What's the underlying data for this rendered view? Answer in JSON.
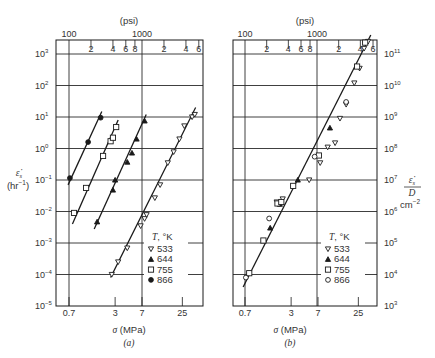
{
  "chart_data": [
    {
      "panel": "a",
      "type": "scatter",
      "caption": "(a)",
      "title": "",
      "xlabel": "σ (MPa)",
      "x_top_label": "(psi)",
      "x_scale": "log",
      "x_ticks_bottom": [
        "0.7",
        "3",
        "7",
        "25"
      ],
      "x_ticks_top_major": [
        "100",
        "1000"
      ],
      "x_ticks_top_minor": [
        "2",
        "4",
        "6",
        "8",
        "2",
        "4",
        "6"
      ],
      "ylabel": "ε̇s (hr⁻¹)",
      "y_scale": "log",
      "ylim": [
        1e-05,
        5000.0
      ],
      "y_ticks": [
        "10^3",
        "10^2",
        "10^1",
        "10^0",
        "10^-1",
        "10^-2",
        "10^-3",
        "10^-4",
        "10^-5"
      ],
      "grid": true,
      "legend": {
        "title": "T, °K",
        "position": "lower right",
        "entries": [
          {
            "marker": "∇",
            "label": "533"
          },
          {
            "marker": "▲",
            "label": "644"
          },
          {
            "marker": "□",
            "label": "755"
          },
          {
            "marker": "●",
            "label": "866"
          }
        ]
      },
      "series": [
        {
          "name": "866",
          "marker": "filled-circle",
          "x": [
            0.72,
            1.28,
            1.9
          ],
          "y": [
            0.115,
            1.6,
            9.5
          ],
          "fit_line": [
            [
              0.68,
              0.07
            ],
            [
              1.97,
              15
            ]
          ]
        },
        {
          "name": "755",
          "marker": "open-square",
          "x": [
            0.82,
            1.2,
            2.05,
            2.6,
            2.8,
            3.1
          ],
          "y": [
            0.009,
            0.056,
            0.58,
            1.7,
            2.2,
            4.8
          ],
          "fit_line": [
            [
              0.78,
              0.004
            ],
            [
              3.3,
              8
            ]
          ]
        },
        {
          "name": "644",
          "marker": "filled-triangle",
          "x": [
            1.7,
            2.8,
            3.0,
            4.4,
            5.1,
            5.9,
            7.6
          ],
          "y": [
            0.0047,
            0.048,
            0.1,
            0.37,
            0.72,
            2.0,
            7.5
          ],
          "fit_line": [
            [
              1.55,
              0.0028
            ],
            [
              8.0,
              12
            ]
          ]
        },
        {
          "name": "533",
          "marker": "open-inverted-triangle",
          "x": [
            2.7,
            3.3,
            4.4,
            6.7,
            7.6,
            8.1,
            10.5,
            12.4,
            15.8,
            19,
            22.8,
            26.6,
            34,
            37
          ],
          "y": [
            0.0001,
            0.00025,
            0.00069,
            0.0035,
            0.0059,
            0.0079,
            0.027,
            0.07,
            0.35,
            0.78,
            2.0,
            5.2,
            10,
            12
          ],
          "fit_line": [
            [
              2.6,
              8e-05
            ],
            [
              38,
              20
            ]
          ]
        }
      ]
    },
    {
      "panel": "b",
      "type": "scatter",
      "caption": "(b)",
      "title": "",
      "xlabel": "σ (MPa)",
      "x_top_label": "(psi)",
      "x_scale": "log",
      "x_ticks_bottom": [
        "0.7",
        "3",
        "7",
        "25"
      ],
      "x_ticks_top_major": [
        "100",
        "1000"
      ],
      "x_ticks_top_minor": [
        "2",
        "4",
        "6",
        "8",
        "2",
        "4",
        "6"
      ],
      "ylabel": "ε̇s / D (cm⁻²)",
      "y_scale": "log",
      "ylim": [
        1000.0,
        500000000000.0
      ],
      "y_ticks": [
        "10^11",
        "10^10",
        "10^9",
        "10^8",
        "10^7",
        "10^6",
        "10^5",
        "10^4",
        "10^3"
      ],
      "grid": true,
      "legend": {
        "title": "T, °K",
        "position": "lower right",
        "entries": [
          {
            "marker": "∇",
            "label": "533"
          },
          {
            "marker": "▲",
            "label": "644"
          },
          {
            "marker": "□",
            "label": "755"
          },
          {
            "marker": "○",
            "label": "866"
          }
        ]
      },
      "series": [
        {
          "name": "533",
          "marker": "open-inverted-triangle",
          "x": [
            1.9,
            2.3,
            5.3,
            7.5,
            9.5,
            12,
            14,
            17,
            22,
            26,
            30,
            34
          ],
          "y": [
            2000000.0,
            2500000.0,
            10000000.0,
            35000000.0,
            110000000.0,
            150000000.0,
            900000000.0,
            2500000000.0,
            12000000000.0,
            35000000000.0,
            150000000000.0,
            250000000000.0
          ],
          "fit_line": [
            [
              0.66,
              4000.0
            ],
            [
              37,
              400000000000.0
            ]
          ]
        },
        {
          "name": "644",
          "marker": "filled-triangle",
          "x": [
            1.55,
            2.1,
            3.7,
            10.2
          ],
          "y": [
            300000.0,
            1700000.0,
            10000000.0,
            450000000.0
          ],
          "fit_line": null
        },
        {
          "name": "755",
          "marker": "open-square",
          "x": [
            0.8,
            1.25,
            1.95,
            2.2,
            3.2,
            7.2,
            24,
            31
          ],
          "y": [
            11000.0,
            120000.0,
            1800000.0,
            2000000.0,
            6500000.0,
            60000000.0,
            40000000000.0,
            230000000000.0
          ],
          "fit_line": null
        },
        {
          "name": "866",
          "marker": "open-circle",
          "x": [
            0.72,
            1.5,
            6.3,
            17
          ],
          "y": [
            8000.0,
            600000.0,
            55000000.0,
            3000000000.0
          ],
          "fit_line": null
        }
      ]
    }
  ],
  "panels": {
    "a": {
      "psi_label": "(psi)",
      "psi_major": [
        "100",
        "1000"
      ],
      "psi_minor": [
        "2",
        "4",
        "6",
        "8",
        "2",
        "4",
        "6"
      ],
      "y_tick_labels": [
        "10",
        "10",
        "10",
        "10",
        "10",
        "10",
        "10",
        "10",
        "10"
      ],
      "y_tick_exps": [
        "3",
        "2",
        "1",
        "0",
        "−1",
        "−2",
        "−3",
        "−4",
        "−5"
      ],
      "x_labels": [
        "0.7",
        "3",
        "7",
        "25"
      ],
      "ylabel_line1": "ε̇",
      "ylabel_sub": "s",
      "ylabel_line2": "(hr",
      "ylabel_exp": "−1",
      "ylabel_close": ")",
      "xlabel_sigma": "σ",
      "xlabel_unit": " (MPa)",
      "caption": "(a)",
      "legend_title": "T, °K",
      "legend": [
        "533",
        "644",
        "755",
        "866"
      ]
    },
    "b": {
      "psi_label": "(psi)",
      "psi_major": [
        "100",
        "1000"
      ],
      "psi_minor": [
        "2",
        "4",
        "6",
        "8",
        "2",
        "4",
        "6"
      ],
      "y_tick_labels": [
        "10",
        "10",
        "10",
        "10",
        "10",
        "10",
        "10",
        "10",
        "10"
      ],
      "y_tick_exps": [
        "11",
        "10",
        "9",
        "8",
        "7",
        "6",
        "5",
        "4",
        "3"
      ],
      "x_labels": [
        "0.7",
        "3",
        "7",
        "25"
      ],
      "ylabel_num": "ε̇",
      "ylabel_sub": "s",
      "ylabel_den": "D",
      "ylabel_unit": "cm",
      "ylabel_unit_exp": "−2",
      "xlabel_sigma": "σ",
      "xlabel_unit": " (MPa)",
      "caption": "(b)",
      "legend_title": "T, °K",
      "legend": [
        "533",
        "644",
        "755",
        "866"
      ]
    }
  },
  "colors": {
    "ink": "#1a1a1a",
    "grid": "#2a2a2a",
    "text": "#333333",
    "background": "#ffffff"
  }
}
